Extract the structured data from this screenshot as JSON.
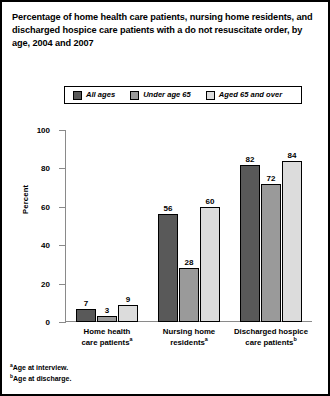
{
  "figure": {
    "title": "Percentage of home health care patients, nursing home residents, and discharged hospice care patients with a do not resuscitate order, by age, 2004 and 2007",
    "border_color": "#000000",
    "background": "#ffffff"
  },
  "legend": {
    "position": "top-center",
    "entries": [
      {
        "label": "All ages",
        "color": "#595959"
      },
      {
        "label": "Under age 65",
        "color": "#9a9a9a"
      },
      {
        "label": "Aged 65 and over",
        "color": "#dcdcdc"
      }
    ]
  },
  "axes": {
    "ylabel": "Percent",
    "yticks": [
      "0",
      "20",
      "40",
      "60",
      "80",
      "100"
    ],
    "ymin": 0,
    "ymax": 100
  },
  "footnotes": [
    {
      "marker": "a",
      "text": "Age at interview."
    },
    {
      "marker": "b",
      "text": "Age at discharge."
    }
  ],
  "categories_display": [
    {
      "line1": "Home health",
      "line2": "care patients",
      "marker": "a"
    },
    {
      "line1": "Nursing home",
      "line2": "residents",
      "marker": "a"
    },
    {
      "line1": "Discharged hospice",
      "line2": "care patients",
      "marker": "b"
    }
  ],
  "chart_data": {
    "type": "bar",
    "title": "Percentage of home health care patients, nursing home residents, and discharged hospice care patients with a do not resuscitate order, by age, 2004 and 2007",
    "xlabel": "",
    "ylabel": "Percent",
    "ylim": [
      0,
      100
    ],
    "ytick_values": [
      0,
      20,
      40,
      60,
      80,
      100
    ],
    "grid": false,
    "legend_position": "top-center",
    "categories": [
      "Home health care patients",
      "Nursing home residents",
      "Discharged hospice care patients"
    ],
    "series": [
      {
        "name": "All ages",
        "color": "#595959",
        "values": [
          7,
          56,
          82
        ]
      },
      {
        "name": "Under age 65",
        "color": "#9a9a9a",
        "values": [
          3,
          28,
          72
        ]
      },
      {
        "name": "Aged 65 and over",
        "color": "#dcdcdc",
        "values": [
          9,
          60,
          84
        ]
      }
    ]
  }
}
